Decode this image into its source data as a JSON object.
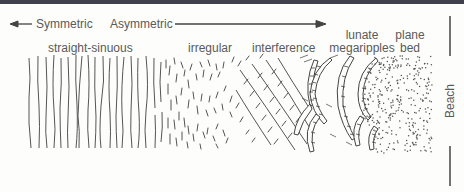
{
  "diagram": {
    "scale_left": "Symmetric",
    "scale_right": "Asymmetric",
    "zones": [
      {
        "id": "straight-sinuous",
        "label": "straight-sinuous"
      },
      {
        "id": "irregular",
        "label": "irregular"
      },
      {
        "id": "interference",
        "label": "interference"
      },
      {
        "id": "lunate-megaripples",
        "label_line1": "lunate",
        "label_line2": "megaripples"
      },
      {
        "id": "plane-bed",
        "label_line1": "plane",
        "label_line2": "bed"
      }
    ],
    "side_label": "Beach",
    "colors": {
      "ink": "#555555",
      "topbar": "#3f4049",
      "background": "#fdfdfb"
    }
  }
}
